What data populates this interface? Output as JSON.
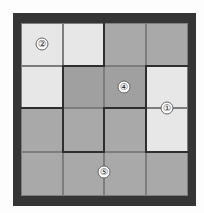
{
  "puzzle": {
    "rows": 4,
    "cols": 4,
    "cells": [
      [
        "light",
        "light",
        "gray",
        "gray"
      ],
      [
        "light",
        "dark",
        "dark",
        "light"
      ],
      [
        "gray",
        "gray",
        "gray",
        "light"
      ],
      [
        "gray",
        "gray",
        "gray",
        "gray"
      ]
    ],
    "clues": [
      {
        "label": "②",
        "value": 2,
        "x": 42,
        "y": 44
      },
      {
        "label": "④",
        "value": 4,
        "x": 124,
        "y": 87
      },
      {
        "label": "①",
        "value": 1,
        "x": 167,
        "y": 108
      },
      {
        "label": "⑤",
        "value": 5,
        "x": 104,
        "y": 172
      }
    ],
    "colors": {
      "frame": "#353535",
      "light": "#e7e7e7",
      "gray": "#a9a9a9",
      "dark": "#a0a0a0",
      "wall": "#2e2e2e"
    }
  }
}
